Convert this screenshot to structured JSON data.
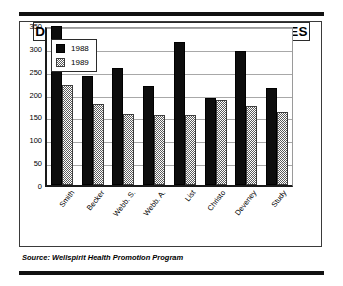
{
  "figure": {
    "title": "DECREASES IN CHOLESTEROL - MALES",
    "source": "Source: Wellspirit Health Promotion Program"
  },
  "legend": {
    "items": [
      {
        "label": "1988",
        "swatch": "solid-black-swatch-icon",
        "color": "#0d0d0d"
      },
      {
        "label": "1989",
        "swatch": "dithered-gray-swatch-icon",
        "color": "#5b5b5b"
      }
    ]
  },
  "axis": {
    "y_ticks": [
      "350",
      "300",
      "250",
      "200",
      "150",
      "100",
      "50",
      "0"
    ]
  },
  "chart_data": {
    "type": "bar",
    "title": "DECREASES IN CHOLESTEROL - MALES",
    "xlabel": "",
    "ylabel": "",
    "ylim": [
      0,
      350
    ],
    "ytick_step": 50,
    "grid": true,
    "legend_position": "inside-top-left",
    "categories": [
      "Smith",
      "Becker",
      "Webb. S.",
      "Webb. A.",
      "List",
      "Christo",
      "Deveney",
      "Study"
    ],
    "series": [
      {
        "name": "1988",
        "color": "#0d0d0d",
        "values": [
          348,
          238,
          256,
          216,
          312,
          190,
          294,
          212
        ]
      },
      {
        "name": "1989",
        "color": "#5b5b5b",
        "values": [
          218,
          177,
          155,
          154,
          153,
          186,
          172,
          160
        ]
      }
    ]
  }
}
